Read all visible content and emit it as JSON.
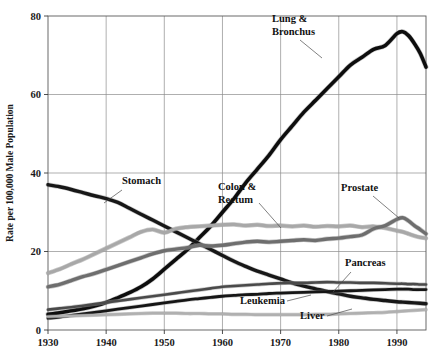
{
  "figure": {
    "background": "#ffffff",
    "plot_box": {
      "left": 48,
      "top": 16,
      "right": 426,
      "bottom": 330
    }
  },
  "axes": {
    "y_label": "Rate per 100,000 Male Population",
    "y_ticks": [
      0,
      20,
      40,
      60,
      80
    ],
    "y_tick_labels": [
      "0",
      "20",
      "40",
      "60",
      "80"
    ],
    "x_ticks": [
      1930,
      1940,
      1950,
      1960,
      1970,
      1980,
      1990
    ],
    "x_tick_labels": [
      "1930",
      "1940",
      "1950",
      "1960",
      "1970",
      "1980",
      "1990"
    ]
  },
  "chart_data": {
    "type": "line",
    "title": "",
    "subtitle": "",
    "xlabel": "",
    "ylabel": "Rate per 100,000 Male Population",
    "xlim": [
      1930,
      1995
    ],
    "ylim": [
      0,
      80
    ],
    "grid": true,
    "legend": "inline-annotations",
    "x": [
      1930,
      1932,
      1934,
      1936,
      1938,
      1940,
      1942,
      1944,
      1946,
      1948,
      1950,
      1952,
      1954,
      1956,
      1958,
      1960,
      1962,
      1964,
      1966,
      1968,
      1970,
      1972,
      1974,
      1976,
      1978,
      1980,
      1982,
      1984,
      1986,
      1988,
      1990,
      1991,
      1992,
      1993,
      1994,
      1995
    ],
    "series": [
      {
        "name": "Lung & Bronchus",
        "color": "#0d0d0d",
        "width": 3.6,
        "label_text": "Lung &\nBronchus",
        "label_xy": [
          272,
          22
        ],
        "values": [
          4.0,
          4.4,
          4.9,
          5.4,
          6.1,
          7.0,
          8.2,
          9.5,
          11.0,
          13.0,
          15.5,
          18.0,
          20.5,
          23.5,
          26.5,
          30.0,
          33.5,
          37.5,
          41.0,
          44.5,
          48.5,
          52.0,
          55.5,
          58.5,
          61.5,
          64.5,
          67.5,
          69.5,
          71.5,
          72.5,
          75.5,
          76.0,
          75.0,
          73.0,
          70.5,
          67.0
        ]
      },
      {
        "name": "Stomach",
        "color": "#171717",
        "width": 3.4,
        "label_text": "Stomach",
        "label_xy": [
          122,
          184
        ],
        "values": [
          37.0,
          36.5,
          35.8,
          35.0,
          34.2,
          33.5,
          32.5,
          31.0,
          29.5,
          28.0,
          26.5,
          25.0,
          23.5,
          22.0,
          20.5,
          19.0,
          17.5,
          16.2,
          15.0,
          14.0,
          13.0,
          12.0,
          11.2,
          10.5,
          9.8,
          9.2,
          8.6,
          8.2,
          7.8,
          7.5,
          7.2,
          7.1,
          7.0,
          6.9,
          6.8,
          6.7
        ]
      },
      {
        "name": "Colon & Rectum",
        "color": "#a8a8a8",
        "width": 3.2,
        "label_text": "Colon &\nRectum",
        "label_xy": [
          218,
          190
        ],
        "values": [
          14.5,
          15.5,
          16.8,
          18.0,
          19.4,
          20.8,
          22.2,
          23.6,
          25.0,
          25.6,
          24.8,
          25.8,
          26.2,
          26.4,
          26.6,
          26.8,
          26.9,
          26.6,
          26.8,
          26.5,
          26.6,
          26.4,
          26.6,
          26.3,
          26.5,
          26.4,
          26.6,
          26.2,
          26.4,
          26.0,
          25.3,
          25.0,
          24.5,
          24.0,
          23.6,
          23.4
        ]
      },
      {
        "name": "Prostate",
        "color": "#6e6e6e",
        "width": 3.4,
        "label_text": "Prostate",
        "label_xy": [
          341,
          191
        ],
        "values": [
          11.0,
          11.6,
          12.6,
          13.6,
          14.4,
          15.4,
          16.4,
          17.4,
          18.4,
          19.4,
          20.2,
          20.6,
          21.0,
          21.6,
          21.4,
          21.6,
          22.0,
          22.4,
          22.6,
          22.4,
          22.6,
          22.8,
          23.0,
          22.8,
          23.2,
          23.4,
          23.8,
          24.2,
          25.8,
          26.6,
          28.2,
          28.6,
          27.8,
          26.6,
          25.6,
          24.5
        ]
      },
      {
        "name": "Pancreas",
        "color": "#4a4a4a",
        "width": 2.6,
        "label_text": "Pancreas",
        "label_xy": [
          345,
          266
        ],
        "values": [
          5.2,
          5.5,
          5.8,
          6.2,
          6.6,
          7.0,
          7.4,
          7.8,
          8.2,
          8.6,
          9.0,
          9.4,
          9.8,
          10.2,
          10.6,
          11.0,
          11.2,
          11.4,
          11.6,
          11.8,
          11.9,
          12.0,
          12.0,
          12.1,
          12.2,
          12.1,
          12.1,
          12.0,
          12.0,
          11.9,
          11.8,
          11.8,
          11.7,
          11.7,
          11.6,
          11.6
        ]
      },
      {
        "name": "Leukemia",
        "color": "#161616",
        "width": 2.8,
        "label_text": "Leukemia",
        "label_xy": [
          240,
          304
        ],
        "values": [
          3.0,
          3.3,
          3.7,
          4.1,
          4.5,
          4.9,
          5.3,
          5.7,
          6.1,
          6.5,
          6.9,
          7.3,
          7.7,
          8.0,
          8.3,
          8.6,
          8.8,
          9.0,
          9.1,
          9.3,
          9.4,
          9.5,
          9.6,
          9.7,
          9.8,
          9.9,
          10.0,
          10.1,
          10.2,
          10.3,
          10.4,
          10.4,
          10.4,
          10.3,
          10.3,
          10.3
        ]
      },
      {
        "name": "Liver",
        "color": "#b0b0b0",
        "width": 2.4,
        "label_text": "Liver",
        "label_xy": [
          300,
          319
        ],
        "values": [
          3.4,
          3.5,
          3.6,
          3.7,
          3.8,
          3.9,
          4.0,
          4.1,
          4.2,
          4.3,
          4.3,
          4.3,
          4.2,
          4.2,
          4.1,
          4.1,
          4.0,
          4.0,
          3.9,
          3.9,
          3.9,
          3.9,
          3.9,
          4.0,
          4.0,
          4.1,
          4.2,
          4.3,
          4.4,
          4.5,
          4.7,
          4.8,
          4.9,
          5.0,
          5.1,
          5.2
        ]
      }
    ]
  },
  "annotations": [
    {
      "name": "lung-bronchus-label",
      "lines": [
        "Lung &",
        "Bronchus"
      ],
      "x": 272,
      "y": 22
    },
    {
      "name": "stomach-label",
      "lines": [
        "Stomach"
      ],
      "x": 122,
      "y": 184
    },
    {
      "name": "colon-rectum-label",
      "lines": [
        "Colon &",
        "Rectum"
      ],
      "x": 218,
      "y": 190
    },
    {
      "name": "prostate-label",
      "lines": [
        "Prostate"
      ],
      "x": 341,
      "y": 191
    },
    {
      "name": "pancreas-label",
      "lines": [
        "Pancreas"
      ],
      "x": 345,
      "y": 266
    },
    {
      "name": "leukemia-label",
      "lines": [
        "Leukemia"
      ],
      "x": 240,
      "y": 304
    },
    {
      "name": "liver-label",
      "lines": [
        "Liver"
      ],
      "x": 300,
      "y": 319
    }
  ]
}
